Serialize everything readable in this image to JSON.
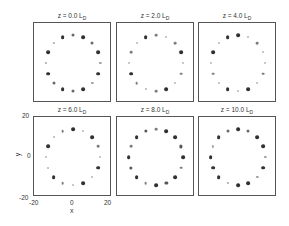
{
  "chart_data": {
    "type": "scatter",
    "title": "",
    "xlabel": "x",
    "ylabel": "y",
    "xlim": [
      -20,
      20
    ],
    "ylim": [
      -20,
      20
    ],
    "xticks": [
      "-20",
      "0",
      "20"
    ],
    "yticks": [
      "20",
      "0",
      "-20"
    ],
    "grid": false,
    "legend": "none",
    "panels": [
      {
        "title": "z = 0.0",
        "unit": "L",
        "sub": "D",
        "n": 16,
        "radius": 14,
        "intensity": [
          0.6,
          0.9,
          0.6,
          0.9,
          0.3,
          0.9,
          0.3,
          0.9,
          0.6,
          0.9,
          0.6,
          0.9,
          0.3,
          0.9,
          0.3,
          0.9
        ]
      },
      {
        "title": "z = 2.0",
        "unit": "L",
        "sub": "D",
        "n": 16,
        "radius": 14,
        "intensity": [
          0.5,
          0.2,
          0.5,
          0.9,
          0.2,
          0.5,
          0.2,
          0.9,
          0.5,
          0.2,
          0.5,
          0.9,
          0.2,
          0.5,
          0.2,
          0.9
        ]
      },
      {
        "title": "z = 4.0",
        "unit": "L",
        "sub": "D",
        "n": 16,
        "radius": 14,
        "intensity": [
          0.9,
          0.2,
          0.5,
          0.2,
          0.2,
          0.5,
          0.2,
          0.9,
          0.2,
          0.9,
          0.2,
          0.5,
          0.2,
          0.9,
          0.2,
          0.9
        ]
      },
      {
        "title": "z = 6.0",
        "unit": "L",
        "sub": "D",
        "n": 16,
        "radius": 14,
        "intensity": [
          0.9,
          0.2,
          0.9,
          0.5,
          0.2,
          0.9,
          0.2,
          0.9,
          0.2,
          0.5,
          0.9,
          0.2,
          0.2,
          0.9,
          0.2,
          0.5
        ]
      },
      {
        "title": "z = 8.0",
        "unit": "L",
        "sub": "D",
        "n": 16,
        "radius": 14,
        "intensity": [
          0.5,
          0.9,
          0.9,
          0.7,
          0.9,
          0.5,
          0.9,
          0.7,
          0.9,
          0.5,
          0.9,
          0.7,
          0.9,
          0.5,
          0.9,
          0.7
        ]
      },
      {
        "title": "z = 10.0",
        "unit": "L",
        "sub": "D",
        "n": 16,
        "radius": 14,
        "intensity": [
          0.9,
          0.6,
          0.9,
          0.9,
          0.3,
          0.9,
          0.3,
          0.9,
          0.9,
          0.3,
          0.9,
          0.9,
          0.9,
          0.3,
          0.9,
          0.6
        ]
      }
    ]
  }
}
